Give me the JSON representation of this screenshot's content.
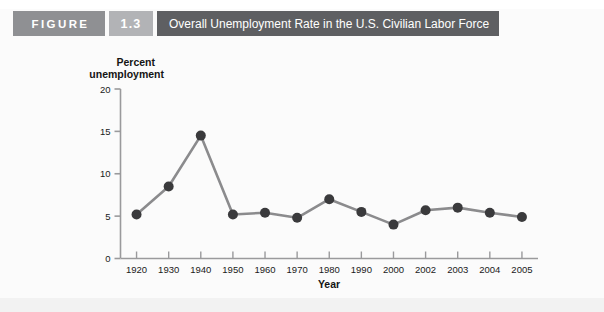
{
  "header": {
    "figure_label": "FIGURE",
    "figure_number": "1.3",
    "title": "Overall Unemployment Rate in the U.S. Civilian Labor Force",
    "figure_badge_color": "#8f9093",
    "number_badge_color": "#b2b3b6",
    "title_bar_color": "#5e5f62"
  },
  "chart_data": {
    "type": "line",
    "title": "Overall Unemployment Rate in the U.S. Civilian Labor Force",
    "xlabel": "Year",
    "ylabel_line1": "Percent",
    "ylabel_line2": "unemployment",
    "categories": [
      "1920",
      "1930",
      "1940",
      "1950",
      "1960",
      "1970",
      "1980",
      "1990",
      "2000",
      "2002",
      "2003",
      "2004",
      "2005"
    ],
    "values": [
      5.2,
      8.5,
      14.5,
      5.2,
      5.4,
      4.8,
      7.0,
      5.5,
      4.0,
      5.7,
      6.0,
      5.4,
      4.9
    ],
    "ylim": [
      0,
      20
    ],
    "yticks": [
      0,
      5,
      10,
      15,
      20
    ],
    "ytick_labels": [
      "0",
      "5",
      "10",
      "15",
      "20"
    ],
    "grid": false,
    "legend": "none",
    "marker": "circle",
    "marker_color": "#3a3a3c",
    "line_color": "#8b8b8d",
    "axis_color": "#9a9a9c",
    "plot_background": "#fbfbfb"
  }
}
